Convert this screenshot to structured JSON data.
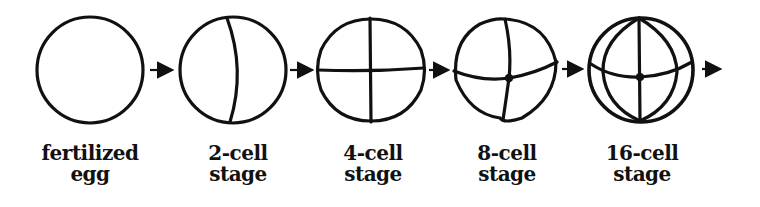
{
  "diagram": {
    "stroke_color": "#111111",
    "stages": [
      {
        "id": "fertilized-egg",
        "line1": "fertilized",
        "line2": "egg",
        "cx": 90
      },
      {
        "id": "2-cell",
        "line1": "2-cell",
        "line2": "stage",
        "cx": 233
      },
      {
        "id": "4-cell",
        "line1": "4-cell",
        "line2": "stage",
        "cx": 371
      },
      {
        "id": "8-cell",
        "line1": "8-cell",
        "line2": "stage",
        "cx": 506
      },
      {
        "id": "16-cell",
        "line1": "16-cell",
        "line2": "stage",
        "cx": 641
      }
    ],
    "arrows": 5
  }
}
